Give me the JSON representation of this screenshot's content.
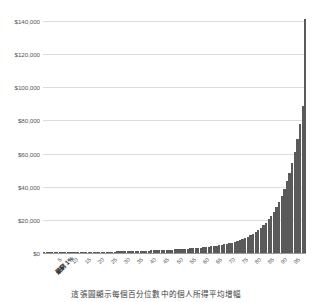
{
  "chart_data": {
    "type": "bar",
    "title": "",
    "subtitle": "",
    "caption": "這張圖顯示每個百分位數中的個人所得平均增幅",
    "xlabel": "",
    "ylabel": "",
    "ylim": [
      0,
      140000
    ],
    "ystep": 20000,
    "grid": true,
    "legend": false,
    "legend_position": "none",
    "bar_color": "#5a5a5a",
    "grid_color": "#dcdcdc",
    "axis_color": "#9a9a9a",
    "background": "#ffffff",
    "ytick_labels": [
      "$0",
      "$20,000",
      "$40,000",
      "$60,000",
      "$80,000",
      "$100,000",
      "$120,000",
      "$140,000"
    ],
    "ytick_values": [
      0,
      20000,
      40000,
      60000,
      80000,
      100000,
      120000,
      140000
    ],
    "xtick_labels": [
      "5",
      "10",
      "15",
      "20",
      "25",
      "30",
      "35",
      "40",
      "45",
      "50",
      "55",
      "60",
      "65",
      "70",
      "75",
      "80",
      "85",
      "90",
      "95"
    ],
    "xtick_positions": [
      5,
      10,
      15,
      20,
      25,
      30,
      35,
      40,
      45,
      50,
      55,
      60,
      65,
      70,
      75,
      80,
      85,
      90,
      95
    ],
    "x_axis_start_label": "最窮 1%",
    "x_axis_end_label": "最富 1%",
    "categories": [
      "最窮 1%",
      "2",
      "3",
      "4",
      "5",
      "6",
      "7",
      "8",
      "9",
      "10",
      "11",
      "12",
      "13",
      "14",
      "15",
      "16",
      "17",
      "18",
      "19",
      "20",
      "21",
      "22",
      "23",
      "24",
      "25",
      "26",
      "27",
      "28",
      "29",
      "30",
      "31",
      "32",
      "33",
      "34",
      "35",
      "36",
      "37",
      "38",
      "39",
      "40",
      "41",
      "42",
      "43",
      "44",
      "45",
      "46",
      "47",
      "48",
      "49",
      "50",
      "51",
      "52",
      "53",
      "54",
      "55",
      "56",
      "57",
      "58",
      "59",
      "60",
      "61",
      "62",
      "63",
      "64",
      "65",
      "66",
      "67",
      "68",
      "69",
      "70",
      "71",
      "72",
      "73",
      "74",
      "75",
      "76",
      "77",
      "78",
      "79",
      "80",
      "81",
      "82",
      "83",
      "84",
      "85",
      "86",
      "87",
      "88",
      "89",
      "90",
      "91",
      "92",
      "93",
      "94",
      "95",
      "96",
      "97",
      "98",
      "99",
      "100",
      "最富 1%"
    ],
    "values": [
      200,
      220,
      240,
      260,
      280,
      300,
      320,
      340,
      360,
      380,
      400,
      420,
      450,
      470,
      500,
      520,
      550,
      580,
      600,
      630,
      660,
      690,
      720,
      750,
      780,
      820,
      850,
      890,
      920,
      960,
      1000,
      1040,
      1080,
      1120,
      1170,
      1210,
      1260,
      1310,
      1360,
      1410,
      1470,
      1520,
      1580,
      1640,
      1700,
      1770,
      1840,
      1910,
      1980,
      2060,
      2140,
      2230,
      2320,
      2410,
      2510,
      2620,
      2730,
      2850,
      2980,
      3110,
      3260,
      3410,
      3580,
      3760,
      3950,
      4160,
      4390,
      4630,
      4900,
      5190,
      5510,
      5870,
      6260,
      6700,
      7180,
      7720,
      8320,
      8990,
      9740,
      10580,
      11520,
      12580,
      13780,
      15130,
      16650,
      18370,
      20300,
      22480,
      24950,
      27740,
      30900,
      34480,
      38540,
      43160,
      48410,
      54400,
      61240,
      69080,
      78080,
      88450,
      141000
    ]
  }
}
